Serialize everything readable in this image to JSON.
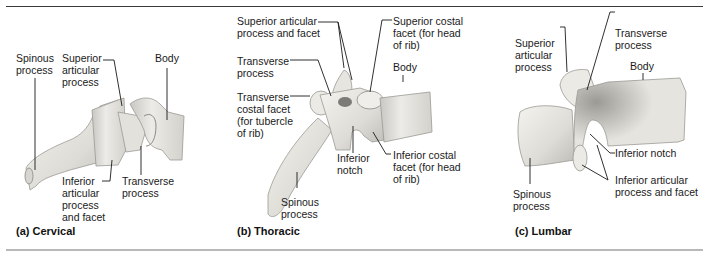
{
  "figure": {
    "panels": [
      {
        "id": "cervical",
        "caption": "(a) Cervical",
        "labels": {
          "spinous_process": "Spinous\nprocess",
          "superior_articular_process": "Superior\narticular\nprocess",
          "body": "Body",
          "inferior_articular_process_facet": "Inferior\narticular\nprocess\nand facet",
          "transverse_process": "Transverse\nprocess"
        }
      },
      {
        "id": "thoracic",
        "caption": "(b) Thoracic",
        "labels": {
          "superior_articular_process_facet": "Superior articular\nprocess and facet",
          "superior_costal_facet": "Superior costal\nfacet (for head\nof rib)",
          "transverse_process": "Transverse\nprocess",
          "body": "Body",
          "transverse_costal_facet": "Transverse\ncostal facet\n(for tubercle\nof rib)",
          "inferior_notch": "Inferior\nnotch",
          "inferior_costal_facet": "Inferior costal\nfacet (for head\nof rib)",
          "spinous_process": "Spinous\nprocess"
        }
      },
      {
        "id": "lumbar",
        "caption": "(c) Lumbar",
        "labels": {
          "superior_articular_process": "Superior\narticular\nprocess",
          "transverse_process": "Transverse\nprocess",
          "body": "Body",
          "inferior_notch": "Inferior notch",
          "spinous_process": "Spinous\nprocess",
          "inferior_articular_process_facet": "Inferior articular\nprocess and facet"
        }
      }
    ],
    "colors": {
      "bone_light": "#efeeea",
      "bone_mid": "#d9d7d1",
      "bone_shadow": "#a9a7a2",
      "leader_line": "#1a1a1a",
      "bottom_rule": "#b8b8b8"
    }
  }
}
